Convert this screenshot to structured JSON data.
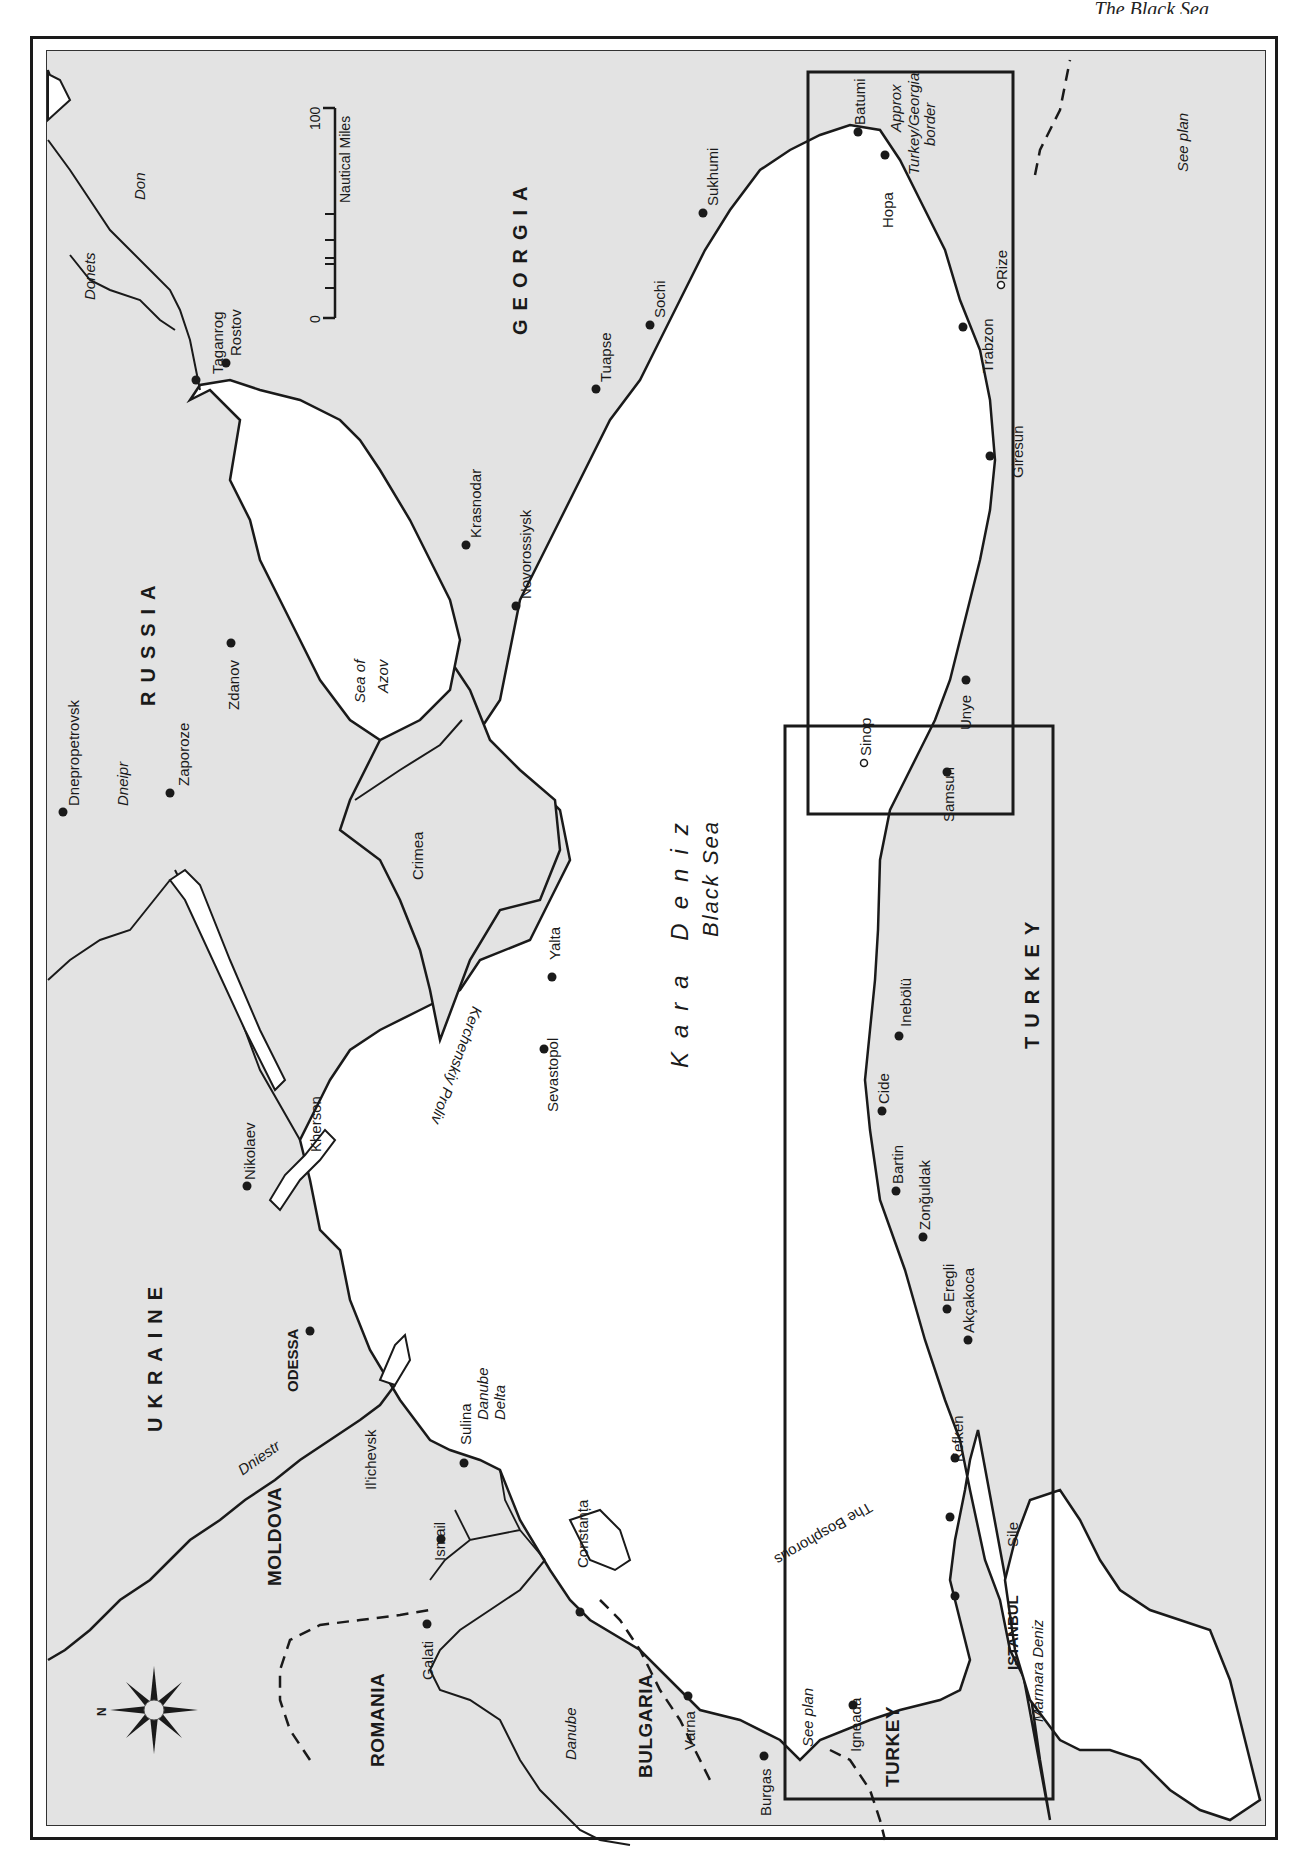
{
  "page": {
    "header": "The Black Sea"
  },
  "map": {
    "orientation": "rotated 90° clockwise; north points left",
    "colors": {
      "land": "#e3e3e3",
      "sea": "#ffffff",
      "ink": "#1a1a1a"
    },
    "compass": {
      "north_label": "N"
    },
    "scale_bar": {
      "min_label": "0",
      "max_label": "100",
      "unit_label": "Nautical Miles"
    },
    "countries": {
      "russia": "RUSSIA",
      "georgia": "GEORGIA",
      "ukraine": "UKRAINE",
      "moldova": "MOLDOVA",
      "romania": "ROMANIA",
      "bulgaria": "BULGARIA",
      "turkey_east": "TURKEY",
      "turkey_west": "TURKEY"
    },
    "seas": {
      "black_sea_local": "Kara Deniz",
      "black_sea_en": "Black Sea",
      "azov_1": "Sea of",
      "azov_2": "Azov",
      "marmara": "Marmara Deniz",
      "kerch_strait": "Kerchenskiy Proliv",
      "bosphorus": "The Bosphorous"
    },
    "rivers": {
      "don": "Don",
      "donets": "Donets",
      "dneipr": "Dneipr",
      "dniestr": "Dniestr",
      "danube": "Danube",
      "danube_delta_1": "Danube",
      "danube_delta_2": "Delta"
    },
    "regions": {
      "crimea": "Crimea"
    },
    "cities": {
      "rostov": "Rostov",
      "taganrog": "Taganrog",
      "zdanov": "Zdanov",
      "dnepropetrovsk": "Dnepropetrovsk",
      "zaporoze": "Zaporoze",
      "krasnodar": "Krasnodar",
      "novorossiysk": "Novorossiysk",
      "tuapse": "Tuapse",
      "sochi": "Sochi",
      "sukhumi": "Sukhumi",
      "batumi": "Batumi",
      "hopa": "Hopa",
      "rize": "Rize",
      "trabzon": "Trabzon",
      "giresun": "Giresun",
      "unye": "Unye",
      "samsun": "Samsun",
      "sinop": "Sinop",
      "inebolu": "Inebölü",
      "cide": "Cide",
      "bartin": "Bartin",
      "zonguldak": "Zonğuldak",
      "eregli": "Eregli",
      "akcakoca": "Akçakoca",
      "kefken": "Kefken",
      "sile": "Sile",
      "istanbul": "ISTANBUL",
      "igneada": "Igneada",
      "burgas": "Burgas",
      "varna": "Varna",
      "constanta": "Constanța",
      "sulina": "Sulina",
      "ismail": "Ismail",
      "galati": "Galati",
      "ilichevsk": "Il'ichevsk",
      "odessa": "ODESSA",
      "nikolaev": "Nikolaev",
      "kherson": "Kherson",
      "yalta": "Yalta",
      "sevastopol": "Sevastopol"
    },
    "annotations": {
      "border_1": "Approx",
      "border_2": "Turkey/Georgia",
      "border_3": "border",
      "see_plan_east": "See plan",
      "see_plan_west": "See plan"
    }
  }
}
